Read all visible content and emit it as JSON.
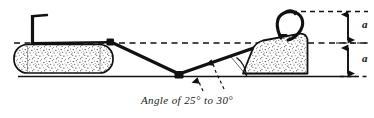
{
  "diagram": {
    "type": "technical-line-drawing",
    "caption": "Angle of 25° to 30°",
    "angle_min_degrees": 25,
    "angle_max_degrees": 30,
    "stroke_color": "#111111",
    "fill_color": "#ffffff",
    "stipple_color": "#1a1a1a",
    "background_color": "#ffffff",
    "labels": {
      "upper_dimension": "a",
      "lower_dimension": "a"
    },
    "parts": {
      "log_name": "log",
      "ramp_name": "earth-ramp",
      "cable_name": "skidding-cable",
      "post_name": "upright-post",
      "hook_name": "cable-hook-loop",
      "ground_name": "ground-line",
      "upper_datum_name": "upper-datum-dashed-line",
      "mid_datum_name": "mid-datum-dashed-line"
    }
  }
}
